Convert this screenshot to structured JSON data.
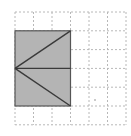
{
  "diagram": {
    "type": "grid-geometry",
    "grid": {
      "cols": 6,
      "rows": 6,
      "origin_x": 15,
      "origin_y": 12,
      "cell_w": 18.5,
      "cell_h": 18.8,
      "line_color": "#b8b8b8",
      "dash": "2,2"
    },
    "shape": {
      "name": "shaded-rectangle",
      "fill": "#b4b4b4",
      "stroke": "#555555",
      "grid_x": 0,
      "grid_y": 1,
      "grid_w": 3,
      "grid_h": 4
    },
    "vertex": {
      "grid_x": 0,
      "grid_y": 3
    },
    "segments": [
      {
        "name": "upper-diagonal",
        "to_grid_x": 3,
        "to_grid_y": 1
      },
      {
        "name": "middle-horizontal",
        "to_grid_x": 3,
        "to_grid_y": 3
      },
      {
        "name": "lower-diagonal",
        "to_grid_x": 3,
        "to_grid_y": 5
      }
    ],
    "marker": {
      "name": "small-dot",
      "x": 95,
      "y": 100,
      "color": "#888888"
    }
  }
}
